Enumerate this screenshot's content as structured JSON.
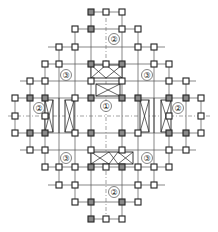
{
  "diagram": {
    "stroke_color": "#222222",
    "background": "#ffffff",
    "zones": [
      {
        "id": "zone-1-center",
        "label": "①",
        "x": 106,
        "y": 106
      },
      {
        "id": "zone-2-top",
        "label": "②",
        "x": 114,
        "y": 39
      },
      {
        "id": "zone-2-bottom",
        "label": "②",
        "x": 114,
        "y": 192
      },
      {
        "id": "zone-2-left",
        "label": "②",
        "x": 39,
        "y": 108
      },
      {
        "id": "zone-2-right",
        "label": "②",
        "x": 178,
        "y": 108
      },
      {
        "id": "zone-3-top-left",
        "label": "③",
        "x": 66,
        "y": 75
      },
      {
        "id": "zone-3-top-right",
        "label": "③",
        "x": 147,
        "y": 75
      },
      {
        "id": "zone-3-bottom-left",
        "label": "③",
        "x": 66,
        "y": 158
      },
      {
        "id": "zone-3-bottom-right",
        "label": "③",
        "x": 147,
        "y": 158
      }
    ]
  }
}
